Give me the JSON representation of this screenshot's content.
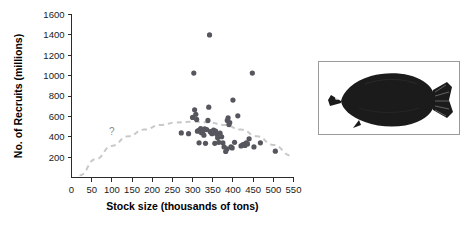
{
  "figure": {
    "kind": "scatter-plot-with-photo",
    "photo": {
      "subject_label": "flatfish-plaice-silhouette",
      "border_color": "#9a9a9a",
      "body_color": "#1b1b1b"
    }
  },
  "chart_data": {
    "type": "scatter",
    "title": "",
    "xlabel": "Stock size (thousands of tons)",
    "ylabel": "No. of Recruits (millions)",
    "xlim": [
      0,
      550
    ],
    "ylim": [
      0,
      1600
    ],
    "xticks": [
      0,
      50,
      100,
      150,
      200,
      250,
      300,
      350,
      400,
      450,
      500,
      550
    ],
    "yticks": [
      200,
      400,
      600,
      800,
      1000,
      1200,
      1400,
      1600
    ],
    "xticklabels": [
      "0",
      "50",
      "100",
      "150",
      "200",
      "250",
      "300",
      "350",
      "400",
      "450",
      "500",
      "550"
    ],
    "yticklabels": [
      "200",
      "400",
      "600",
      "800",
      "1000",
      "1200",
      "1400",
      "1600"
    ],
    "grid": false,
    "legend": false,
    "point_color": "#56565e",
    "point_radius": 2.6,
    "x": [
      272,
      290,
      300,
      303,
      305,
      308,
      310,
      312,
      315,
      316,
      318,
      320,
      322,
      325,
      328,
      330,
      332,
      335,
      338,
      340,
      342,
      344,
      346,
      348,
      350,
      352,
      355,
      357,
      360,
      362,
      365,
      368,
      372,
      375,
      378,
      382,
      385,
      386,
      388,
      390,
      392,
      395,
      398,
      400,
      404,
      412,
      420,
      424,
      427,
      430,
      433,
      436,
      440,
      448,
      452,
      468,
      505
    ],
    "y": [
      438,
      430,
      590,
      1025,
      665,
      620,
      570,
      455,
      460,
      340,
      465,
      480,
      440,
      450,
      415,
      478,
      335,
      470,
      560,
      690,
      1400,
      450,
      445,
      430,
      440,
      465,
      335,
      455,
      425,
      390,
      345,
      435,
      400,
      340,
      300,
      255,
      280,
      560,
      585,
      520,
      540,
      300,
      290,
      760,
      345,
      605,
      310,
      320,
      325,
      315,
      340,
      330,
      380,
      1025,
      300,
      340,
      258
    ],
    "annotations": [
      {
        "text": "?",
        "x": 100,
        "y": 455,
        "color": "#8d8d8d"
      }
    ],
    "trend_curve": {
      "style": "dashed",
      "color": "#c9c9c9",
      "description": "hump-shaped stock-recruitment curve, dashed, uncertain at low stock sizes",
      "x": [
        20,
        60,
        100,
        140,
        180,
        220,
        260,
        300,
        340,
        380,
        420,
        460,
        500,
        545
      ],
      "y": [
        20,
        180,
        310,
        405,
        470,
        515,
        540,
        548,
        540,
        515,
        470,
        405,
        320,
        215
      ]
    }
  }
}
